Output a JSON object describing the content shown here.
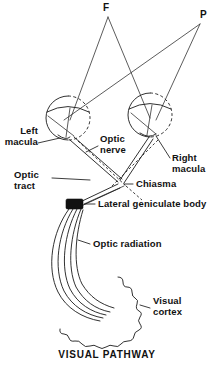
{
  "figure": {
    "caption": "VISUAL PATHWAY",
    "ink_color": "#111111",
    "background_color": "#ffffff"
  },
  "stimulus_points": [
    {
      "id": "F",
      "label": "F",
      "meaning": "fixation-point",
      "x": 108,
      "y": 12
    },
    {
      "id": "P",
      "label": "P",
      "meaning": "peripheral-point",
      "x": 203,
      "y": 20
    }
  ],
  "labels": [
    {
      "id": "left-macula",
      "line1": "Left",
      "line2": "macula",
      "text": "Left macula"
    },
    {
      "id": "right-macula",
      "line1": "Right",
      "line2": "macula",
      "text": "Right macula"
    },
    {
      "id": "optic-nerve",
      "line1": "Optic",
      "line2": "nerve",
      "text": "Optic nerve"
    },
    {
      "id": "optic-tract",
      "line1": "Optic",
      "line2": "tract",
      "text": "Optic tract"
    },
    {
      "id": "chiasma",
      "line1": "Chiasma",
      "line2": "",
      "text": "Chiasma"
    },
    {
      "id": "lateral-geniculate-body",
      "line1": "Lateral geniculate body",
      "line2": "",
      "text": "Lateral geniculate body"
    },
    {
      "id": "optic-radiation",
      "line1": "Optic radiation",
      "line2": "",
      "text": "Optic radiation"
    },
    {
      "id": "visual-cortex",
      "line1": "Visual",
      "line2": "cortex",
      "text": "Visual cortex"
    }
  ],
  "structures": [
    {
      "id": "left-eye",
      "name": "left eyeball",
      "cx": 68,
      "cy": 118,
      "r": 22
    },
    {
      "id": "right-eye",
      "name": "right eyeball",
      "cx": 150,
      "cy": 115,
      "r": 22
    },
    {
      "id": "chiasma",
      "name": "optic chiasma",
      "x": 116,
      "y": 183
    },
    {
      "id": "lateral-geniculate-body",
      "name": "lateral geniculate body",
      "x": 71,
      "y": 205
    },
    {
      "id": "visual-cortex",
      "name": "visual cortex",
      "x": 95,
      "y": 300
    }
  ]
}
